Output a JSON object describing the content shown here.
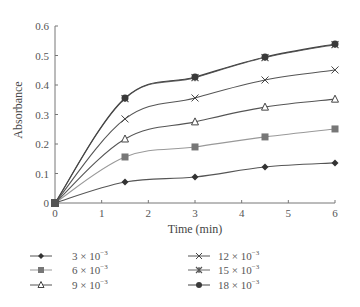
{
  "chart_data": {
    "type": "line",
    "title": "",
    "xlabel": "Time (min)",
    "ylabel": "Absorbance",
    "xlim": [
      0,
      6
    ],
    "ylim": [
      0,
      0.6
    ],
    "xticks": [
      "0",
      "1",
      "2",
      "3",
      "4",
      "5",
      "6"
    ],
    "yticks": [
      "0",
      "0.1",
      "0.2",
      "0.3",
      "0.4",
      "0.5",
      "0.6"
    ],
    "grid": false,
    "legend_position": "bottom",
    "x": [
      0,
      1.5,
      3,
      4.5,
      6
    ],
    "series": [
      {
        "name": "3 × 10⁻³",
        "label_base": "3 × 10",
        "label_exp": "−3",
        "marker": "diamond",
        "color": "#333333",
        "line_color": "#555555",
        "values": [
          0,
          0.071,
          0.088,
          0.122,
          0.136
        ]
      },
      {
        "name": "6 × 10⁻³",
        "label_base": "6 × 10",
        "label_exp": "−3",
        "marker": "square",
        "color": "#777777",
        "line_color": "#999999",
        "values": [
          0,
          0.156,
          0.19,
          0.224,
          0.251
        ]
      },
      {
        "name": "9 × 10⁻³",
        "label_base": "9 × 10",
        "label_exp": "−3",
        "marker": "triangle-open",
        "color": "#444444",
        "line_color": "#555555",
        "values": [
          0,
          0.217,
          0.275,
          0.325,
          0.352
        ]
      },
      {
        "name": "12 × 10⁻³",
        "label_base": "12 × 10",
        "label_exp": "−3",
        "marker": "x",
        "color": "#444444",
        "line_color": "#555555",
        "values": [
          0,
          0.285,
          0.356,
          0.417,
          0.451
        ]
      },
      {
        "name": "15 × 10⁻³",
        "label_base": "15 × 10",
        "label_exp": "−3",
        "marker": "asterisk",
        "color": "#555555",
        "line_color": "#666666",
        "values": [
          0,
          0.354,
          0.425,
          0.493,
          0.537
        ]
      },
      {
        "name": "18 × 10⁻³",
        "label_base": "18 × 10",
        "label_exp": "−3",
        "marker": "circle",
        "color": "#3a3a3a",
        "line_color": "#444444",
        "values": [
          0,
          0.356,
          0.427,
          0.495,
          0.539
        ]
      }
    ]
  }
}
